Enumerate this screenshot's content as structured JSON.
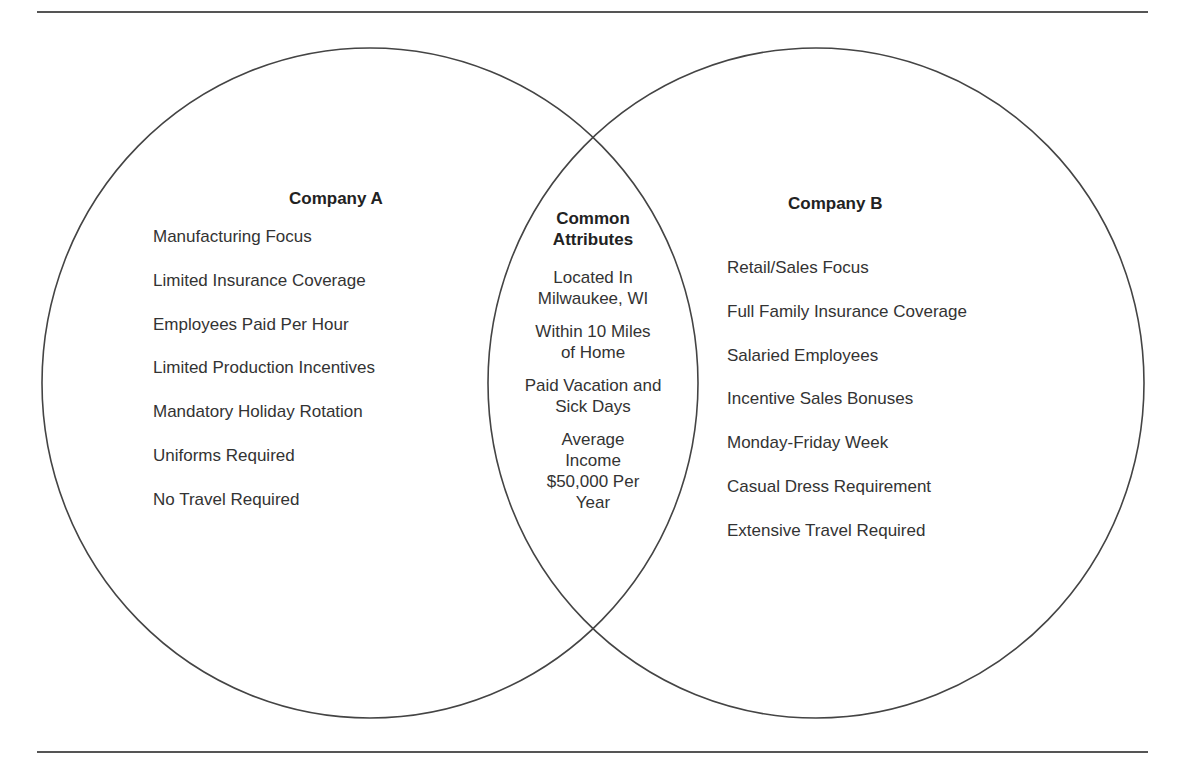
{
  "figure": {
    "type": "venn-diagram",
    "left_set": {
      "title": "Company A",
      "items": [
        "Manufacturing Focus",
        "Limited Insurance Coverage",
        "Employees Paid Per Hour",
        "Limited Production Incentives",
        "Mandatory Holiday Rotation",
        "Uniforms Required",
        "No Travel Required"
      ]
    },
    "intersection": {
      "title": "Common Attributes",
      "title_lines": [
        "Common",
        "Attributes"
      ],
      "items": [
        {
          "lines": [
            "Located In",
            "Milwaukee, WI"
          ]
        },
        {
          "lines": [
            "Within 10 Miles",
            "of Home"
          ]
        },
        {
          "lines": [
            "Paid Vacation and",
            "Sick Days"
          ]
        },
        {
          "lines": [
            "Average",
            "Income",
            "$50,000 Per",
            "Year"
          ]
        }
      ]
    },
    "right_set": {
      "title": "Company B",
      "items": [
        "Retail/Sales Focus",
        "Full Family Insurance Coverage",
        "Salaried Employees",
        "Incentive Sales Bonuses",
        "Monday-Friday Week",
        "Casual Dress Requirement",
        "Extensive Travel Required"
      ]
    },
    "colors": {
      "stroke": "#444444",
      "rule": "#555555",
      "text": "#2a2a2a",
      "background": "#ffffff"
    }
  }
}
